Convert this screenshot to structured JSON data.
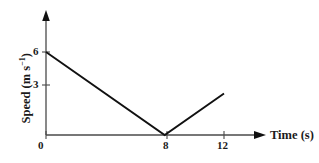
{
  "chart_data": {
    "type": "line",
    "title": "",
    "xlabel": "Time (s)",
    "ylabel": "Speed (m s⁻¹)",
    "ylabel_base": "Speed (m s",
    "ylabel_exponent": "−1",
    "ylabel_close": ")",
    "xlabel_text": "Time (s)",
    "x": [
      0,
      8,
      12
    ],
    "values": [
      6,
      0,
      3
    ],
    "series": [
      {
        "name": "speed",
        "points": [
          {
            "x": 0,
            "y": 6
          },
          {
            "x": 8,
            "y": 0
          },
          {
            "x": 12,
            "y": 3
          }
        ]
      }
    ],
    "xlim": [
      0,
      13.5
    ],
    "ylim": [
      0,
      7
    ],
    "xticks": [
      0,
      8,
      12
    ],
    "xtick_labels": [
      "0",
      "8",
      "12"
    ],
    "yticks": [
      3,
      6
    ],
    "ytick_labels": [
      "3",
      "6"
    ],
    "grid": false,
    "legend": false,
    "axis_arrows": true,
    "line_color": "#111111",
    "axis_color": "#4a4a4a",
    "background_color": "#ffffff",
    "text_color": "#1a1a1a"
  },
  "axis": {
    "x_title": "Time (s)",
    "y_title_base": "Speed (m s",
    "y_title_sup": "−1",
    "y_title_tail": ")"
  },
  "ticks": {
    "y": [
      "6",
      "3"
    ],
    "x": [
      "0",
      "8",
      "12"
    ]
  }
}
